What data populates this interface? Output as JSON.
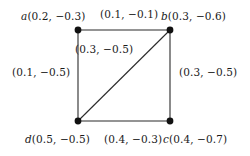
{
  "figure": {
    "background_color": "#ffffff",
    "line_color": "#2b2b2b",
    "node_color": "#111111"
  },
  "graph": {
    "type": "undirected-weighted-graph",
    "nodes": [
      {
        "id": "a",
        "name": "a",
        "value": "(0.2, −0.3)",
        "label": "a(0.2, −0.3)",
        "x": 78,
        "y": 30
      },
      {
        "id": "b",
        "name": "b",
        "value": "(0.3, −0.6)",
        "label": "b(0.3, −0.6)",
        "x": 170,
        "y": 30
      },
      {
        "id": "c",
        "name": "c",
        "value": "(0.4, −0.7)",
        "label": "c(0.4, −0.7)",
        "x": 170,
        "y": 121
      },
      {
        "id": "d",
        "name": "d",
        "value": "(0.5, −0.5)",
        "label": "d(0.5, −0.5)",
        "x": 78,
        "y": 121
      }
    ],
    "edges": [
      {
        "id": "ab",
        "from": "a",
        "to": "b",
        "label": "(0.1, −0.1)",
        "position": "top"
      },
      {
        "id": "ad",
        "from": "a",
        "to": "d",
        "label": "(0.1, −0.5)",
        "position": "left"
      },
      {
        "id": "bc",
        "from": "b",
        "to": "c",
        "label": "(0.3, −0.5)",
        "position": "right"
      },
      {
        "id": "dc",
        "from": "d",
        "to": "c",
        "label": "(0.4, −0.3)",
        "position": "bottom"
      },
      {
        "id": "db",
        "from": "d",
        "to": "b",
        "label": "(0.3, −0.5)",
        "position": "diagonal"
      }
    ]
  }
}
